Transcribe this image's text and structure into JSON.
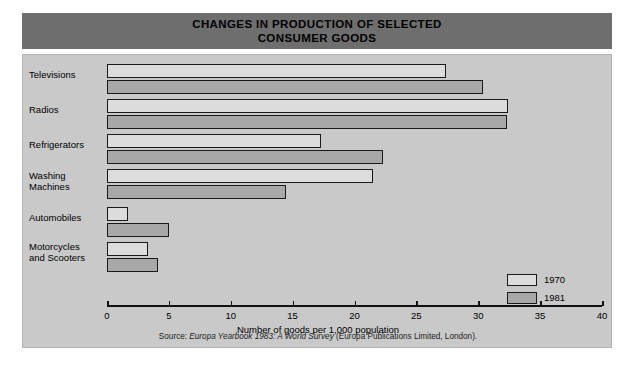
{
  "title": "CHANGES IN PRODUCTION OF SELECTED\nCONSUMER GOODS",
  "source_prefix": "Source: ",
  "source_italic": "Europa Yearbook 1983: A World Survey",
  "source_suffix": " (Europa Publications Limited, London).",
  "colors": {
    "banner": "#6e6e6e",
    "panel": "#c9c9c9",
    "bar_1970": "#dcdcdc",
    "bar_1981": "#a8a8a8",
    "outline": "#1a1a1a"
  },
  "legend": {
    "items": [
      {
        "label": "1970",
        "key": "y1970"
      },
      {
        "label": "1981",
        "key": "y1981"
      }
    ]
  },
  "chart_data": {
    "type": "bar",
    "orientation": "horizontal",
    "title": "CHANGES IN PRODUCTION OF SELECTED CONSUMER GOODS",
    "xlabel": "Number of goods per 1,000 population",
    "ylabel": "",
    "xlim": [
      0,
      40
    ],
    "xticks": [
      0,
      5,
      10,
      15,
      20,
      25,
      30,
      35,
      40
    ],
    "xtick_labels": [
      "0",
      "5",
      "10",
      "15",
      "20",
      "25",
      "30",
      "35",
      "40"
    ],
    "grid": false,
    "legend_position": "right-inside",
    "categories": [
      "Televisions",
      "Radios",
      "Refrigerators",
      "Washing\nMachines",
      "Automobiles",
      "Motorcycles\nand Scooters"
    ],
    "series": [
      {
        "name": "1970",
        "values": [
          27.4,
          32.4,
          17.3,
          21.5,
          1.7,
          3.3
        ]
      },
      {
        "name": "1981",
        "values": [
          30.4,
          32.3,
          22.3,
          14.5,
          5.0,
          4.1
        ]
      }
    ]
  }
}
